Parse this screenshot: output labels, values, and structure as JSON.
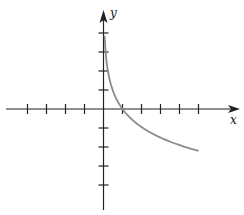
{
  "chart_data": {
    "type": "line",
    "title": "",
    "xlabel": "x",
    "ylabel": "y",
    "xlim": [
      -5,
      7
    ],
    "ylim": [
      -5,
      5
    ],
    "grid": false,
    "x_ticks": [
      -4,
      -3,
      -2,
      -1,
      1,
      2,
      3,
      4,
      5
    ],
    "y_ticks": [
      -4,
      -3,
      -2,
      -1,
      1,
      2,
      3,
      4
    ],
    "tick_labels_shown": false,
    "series": [
      {
        "name": "y = -c·ln(x)",
        "color": "#8a8a8a",
        "x": [
          0.1,
          0.25,
          0.5,
          1,
          2,
          3,
          4,
          5
        ],
        "y": [
          3.9,
          1.9,
          0.95,
          0,
          -0.95,
          -1.5,
          -1.9,
          -2.2
        ]
      }
    ]
  },
  "axes": {
    "x_label": "x",
    "y_label": "y",
    "axis_color": "#222222",
    "curve_color": "#8a8a8a"
  }
}
